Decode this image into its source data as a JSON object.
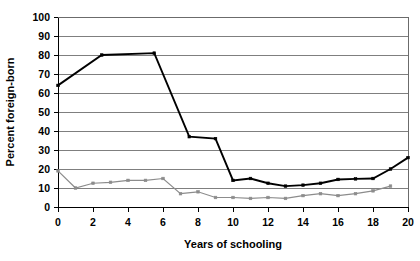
{
  "chart_data": {
    "type": "line",
    "title": "",
    "xlabel": "Years of schooling",
    "ylabel": "Percent foreign-born",
    "xlim": [
      0,
      20
    ],
    "ylim": [
      0,
      100
    ],
    "xticks": [
      0,
      2,
      4,
      6,
      8,
      10,
      12,
      14,
      16,
      18,
      20
    ],
    "yticks": [
      0,
      10,
      20,
      30,
      40,
      50,
      60,
      70,
      80,
      90,
      100
    ],
    "grid": "horizontal",
    "legend": "none",
    "series": [
      {
        "name": "black-series",
        "color": "#000000",
        "marker": "square",
        "points": [
          [
            0,
            64
          ],
          [
            2.5,
            80
          ],
          [
            5.5,
            81
          ],
          [
            7.5,
            37
          ],
          [
            9,
            36
          ],
          [
            10,
            14
          ],
          [
            11,
            15
          ],
          [
            12,
            12.5
          ],
          [
            13,
            11
          ],
          [
            14,
            11.5
          ],
          [
            15,
            12.5
          ],
          [
            16,
            14.5
          ],
          [
            17,
            14.8
          ],
          [
            18,
            15
          ],
          [
            19,
            20
          ],
          [
            20,
            26
          ]
        ]
      },
      {
        "name": "gray-series",
        "color": "#8c8c8c",
        "marker": "square",
        "points": [
          [
            0,
            19
          ],
          [
            1,
            10
          ],
          [
            2,
            12.5
          ],
          [
            3,
            13
          ],
          [
            4,
            14
          ],
          [
            5,
            14
          ],
          [
            6,
            15
          ],
          [
            7,
            7
          ],
          [
            8,
            8
          ],
          [
            9,
            5
          ],
          [
            10,
            5
          ],
          [
            11,
            4.5
          ],
          [
            12,
            5
          ],
          [
            13,
            4.5
          ],
          [
            14,
            6
          ],
          [
            15,
            7
          ],
          [
            16,
            6
          ],
          [
            17,
            7
          ],
          [
            18,
            8.5
          ],
          [
            19,
            11
          ]
        ]
      }
    ]
  },
  "tick_labels": {
    "x": [
      "0",
      "2",
      "4",
      "6",
      "8",
      "10",
      "12",
      "14",
      "16",
      "18",
      "20"
    ],
    "y": [
      "0",
      "10",
      "20",
      "30",
      "40",
      "50",
      "60",
      "70",
      "80",
      "90",
      "100"
    ]
  },
  "axis_titles": {
    "x": "Years of schooling",
    "y": "Percent foreign-born"
  },
  "colors": {
    "black_series": "#000000",
    "gray_series": "#8c8c8c",
    "gridline": "#7f7f7f",
    "axis": "#000000",
    "background": "#ffffff"
  }
}
